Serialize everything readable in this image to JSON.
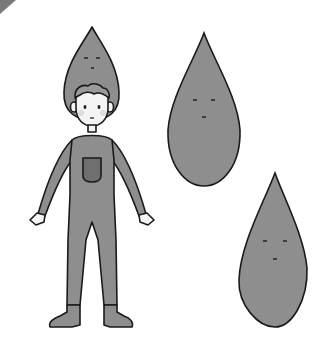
{
  "illustration": {
    "description": "Child in grey teardrop costume beside two teardrop characters",
    "colors": {
      "background": "#ffffff",
      "body": "#8e8e8e",
      "pocket": "#6f6f6f",
      "outline": "#1a1a1a",
      "skin": "#f4f4f4",
      "hair": "#9a9a9a",
      "corner": "#7a7a7a"
    },
    "elements": [
      "corner-triangle",
      "costume-child",
      "teardrop-character-large",
      "teardrop-character-small"
    ]
  }
}
